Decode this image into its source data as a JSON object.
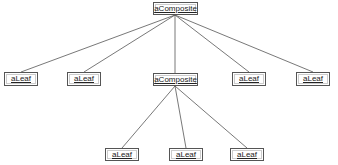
{
  "diagram": {
    "root": {
      "label": "aComposite"
    },
    "level1": [
      {
        "label": "aLeaf"
      },
      {
        "label": "aLeaf"
      },
      {
        "label": "aComposite"
      },
      {
        "label": "aLeaf"
      },
      {
        "label": "aLeaf"
      }
    ],
    "level2": [
      {
        "label": "aLeaf"
      },
      {
        "label": "aLeaf"
      },
      {
        "label": "aLeaf"
      }
    ],
    "colors": {
      "line": "#555555",
      "border": "#555555",
      "text": "#222222",
      "background": "#ffffff"
    }
  }
}
